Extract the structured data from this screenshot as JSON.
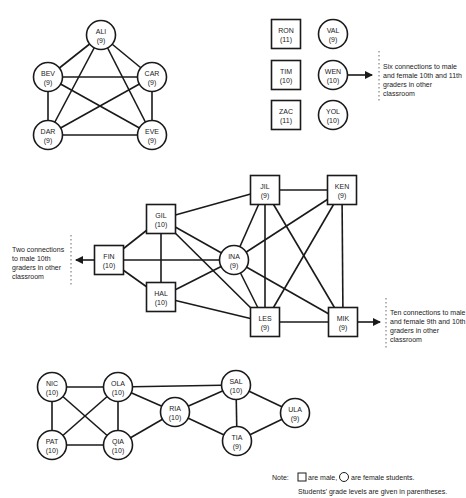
{
  "nodes": [
    {
      "id": "ALI",
      "grade": "(9)",
      "shape": "circle",
      "x": 101,
      "y": 35
    },
    {
      "id": "BEV",
      "grade": "(9)",
      "shape": "circle",
      "x": 48,
      "y": 77
    },
    {
      "id": "CAR",
      "grade": "(9)",
      "shape": "circle",
      "x": 152,
      "y": 77
    },
    {
      "id": "DAR",
      "grade": "(9)",
      "shape": "circle",
      "x": 48,
      "y": 135
    },
    {
      "id": "EVE",
      "grade": "(9)",
      "shape": "circle",
      "x": 152,
      "y": 135
    },
    {
      "id": "RON",
      "grade": "(11)",
      "shape": "square",
      "x": 286,
      "y": 34
    },
    {
      "id": "VAL",
      "grade": "(9)",
      "shape": "circle",
      "x": 333,
      "y": 34
    },
    {
      "id": "TIM",
      "grade": "(10)",
      "shape": "square",
      "x": 286,
      "y": 75
    },
    {
      "id": "WEN",
      "grade": "(10)",
      "shape": "circle",
      "x": 333,
      "y": 75
    },
    {
      "id": "ZAC",
      "grade": "(11)",
      "shape": "square",
      "x": 286,
      "y": 115
    },
    {
      "id": "YOL",
      "grade": "(10)",
      "shape": "circle",
      "x": 333,
      "y": 115
    },
    {
      "id": "GIL",
      "grade": "(10)",
      "shape": "square",
      "x": 161,
      "y": 219
    },
    {
      "id": "FIN",
      "grade": "(10)",
      "shape": "square",
      "x": 109,
      "y": 260
    },
    {
      "id": "HAL",
      "grade": "(10)",
      "shape": "square",
      "x": 161,
      "y": 297
    },
    {
      "id": "INA",
      "grade": "(9)",
      "shape": "circle",
      "x": 234,
      "y": 260
    },
    {
      "id": "JIL",
      "grade": "(9)",
      "shape": "square",
      "x": 265,
      "y": 190
    },
    {
      "id": "KEN",
      "grade": "(9)",
      "shape": "square",
      "x": 342,
      "y": 190
    },
    {
      "id": "LES",
      "grade": "(9)",
      "shape": "square",
      "x": 265,
      "y": 322
    },
    {
      "id": "MIK",
      "grade": "(9)",
      "shape": "square",
      "x": 343,
      "y": 322
    },
    {
      "id": "NIC",
      "grade": "(10)",
      "shape": "circle",
      "x": 52,
      "y": 387
    },
    {
      "id": "OLA",
      "grade": "(10)",
      "shape": "circle",
      "x": 118,
      "y": 387
    },
    {
      "id": "PAT",
      "grade": "(10)",
      "shape": "circle",
      "x": 52,
      "y": 445
    },
    {
      "id": "QIA",
      "grade": "(10)",
      "shape": "circle",
      "x": 118,
      "y": 445
    },
    {
      "id": "RIA",
      "grade": "(10)",
      "shape": "circle",
      "x": 175,
      "y": 412
    },
    {
      "id": "SAL",
      "grade": "(10)",
      "shape": "circle",
      "x": 236,
      "y": 385
    },
    {
      "id": "TIA",
      "grade": "(9)",
      "shape": "circle",
      "x": 237,
      "y": 441
    },
    {
      "id": "ULA",
      "grade": "(9)",
      "shape": "circle",
      "x": 295,
      "y": 413
    }
  ],
  "edges": [
    [
      "ALI",
      "BEV"
    ],
    [
      "ALI",
      "CAR"
    ],
    [
      "ALI",
      "DAR"
    ],
    [
      "ALI",
      "EVE"
    ],
    [
      "BEV",
      "CAR"
    ],
    [
      "BEV",
      "DAR"
    ],
    [
      "BEV",
      "EVE"
    ],
    [
      "CAR",
      "DAR"
    ],
    [
      "CAR",
      "EVE"
    ],
    [
      "DAR",
      "EVE"
    ],
    [
      "FIN",
      "GIL"
    ],
    [
      "FIN",
      "HAL"
    ],
    [
      "FIN",
      "INA"
    ],
    [
      "GIL",
      "HAL"
    ],
    [
      "GIL",
      "JIL"
    ],
    [
      "GIL",
      "INA"
    ],
    [
      "GIL",
      "LES"
    ],
    [
      "HAL",
      "INA"
    ],
    [
      "HAL",
      "LES"
    ],
    [
      "JIL",
      "KEN"
    ],
    [
      "JIL",
      "INA"
    ],
    [
      "JIL",
      "LES"
    ],
    [
      "JIL",
      "MIK"
    ],
    [
      "KEN",
      "INA"
    ],
    [
      "KEN",
      "LES"
    ],
    [
      "KEN",
      "MIK"
    ],
    [
      "INA",
      "LES"
    ],
    [
      "INA",
      "MIK"
    ],
    [
      "LES",
      "MIK"
    ],
    [
      "NIC",
      "OLA"
    ],
    [
      "NIC",
      "PAT"
    ],
    [
      "NIC",
      "QIA"
    ],
    [
      "OLA",
      "PAT"
    ],
    [
      "OLA",
      "QIA"
    ],
    [
      "OLA",
      "RIA"
    ],
    [
      "OLA",
      "SAL"
    ],
    [
      "PAT",
      "QIA"
    ],
    [
      "QIA",
      "RIA"
    ],
    [
      "RIA",
      "SAL"
    ],
    [
      "RIA",
      "TIA"
    ],
    [
      "SAL",
      "TIA"
    ],
    [
      "SAL",
      "ULA"
    ],
    [
      "TIA",
      "ULA"
    ]
  ],
  "annotations": {
    "wen": "Six connections to male and female 10th and 11th graders in other classroom",
    "fin": "Two connections to male 10th graders in other classroom",
    "mik": "Ten connections to male and female 9th and 10th graders in other classroom"
  },
  "note": {
    "label": "Note:",
    "male": "are male,",
    "female": "are female students.",
    "grades": "Students' grade levels are given in parentheses."
  }
}
